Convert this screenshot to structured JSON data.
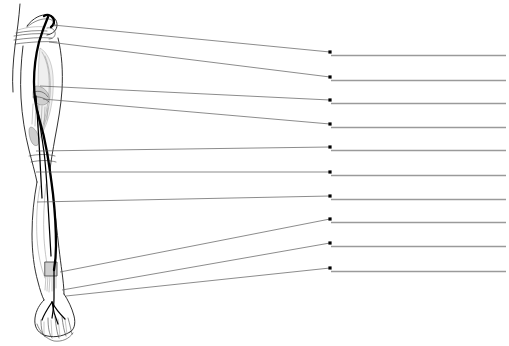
{
  "worksheet": {
    "title": "Lower limb nerve pathway labeling diagram",
    "subject": "leg-lateral-view-with-nerve",
    "background_color": "#ffffff",
    "width": 509,
    "height": 346
  },
  "figure": {
    "name": "leg-anatomy-figure",
    "outline_color": "#1a1a1a",
    "nerve_color": "#000000",
    "shading_color": "#efefef",
    "parts": [
      {
        "name": "hip-pelvis-region",
        "x": 16,
        "y": 14
      },
      {
        "name": "thigh-region",
        "x": 30,
        "y": 60
      },
      {
        "name": "knee-region",
        "x": 40,
        "y": 100
      },
      {
        "name": "lower-leg-region",
        "x": 48,
        "y": 200
      },
      {
        "name": "ankle-region",
        "x": 50,
        "y": 272
      },
      {
        "name": "foot-toes-region",
        "x": 48,
        "y": 315
      }
    ]
  },
  "labels": {
    "count": 10,
    "dot_color": "#000000",
    "leader_color": "#5a5a5a",
    "rule_color": "#9a9a9a",
    "items": [
      {
        "id": 1,
        "name": "label-line-1",
        "origin_x": 53,
        "origin_y": 25,
        "dot_x": 330,
        "dot_y": 52,
        "rule_end_x": 506,
        "answer": ""
      },
      {
        "id": 2,
        "name": "label-line-2",
        "origin_x": 49,
        "origin_y": 42,
        "dot_x": 330,
        "dot_y": 77,
        "rule_end_x": 506,
        "answer": ""
      },
      {
        "id": 3,
        "name": "label-line-3",
        "origin_x": 40,
        "origin_y": 86,
        "dot_x": 330,
        "dot_y": 100,
        "rule_end_x": 506,
        "answer": ""
      },
      {
        "id": 4,
        "name": "label-line-4",
        "origin_x": 43,
        "origin_y": 99,
        "dot_x": 330,
        "dot_y": 124,
        "rule_end_x": 506,
        "answer": ""
      },
      {
        "id": 5,
        "name": "label-line-5",
        "origin_x": 36,
        "origin_y": 151,
        "dot_x": 330,
        "dot_y": 147,
        "rule_end_x": 506,
        "answer": ""
      },
      {
        "id": 6,
        "name": "label-line-6",
        "origin_x": 36,
        "origin_y": 172,
        "dot_x": 330,
        "dot_y": 172,
        "rule_end_x": 506,
        "answer": ""
      },
      {
        "id": 7,
        "name": "label-line-7",
        "origin_x": 37,
        "origin_y": 202,
        "dot_x": 330,
        "dot_y": 196,
        "rule_end_x": 506,
        "answer": ""
      },
      {
        "id": 8,
        "name": "label-line-8",
        "origin_x": 60,
        "origin_y": 272,
        "dot_x": 330,
        "dot_y": 219,
        "rule_end_x": 506,
        "answer": ""
      },
      {
        "id": 9,
        "name": "label-line-9",
        "origin_x": 62,
        "origin_y": 290,
        "dot_x": 330,
        "dot_y": 243,
        "rule_end_x": 506,
        "answer": ""
      },
      {
        "id": 10,
        "name": "label-line-10",
        "origin_x": 66,
        "origin_y": 296,
        "dot_x": 330,
        "dot_y": 268,
        "rule_end_x": 506,
        "answer": ""
      }
    ]
  }
}
